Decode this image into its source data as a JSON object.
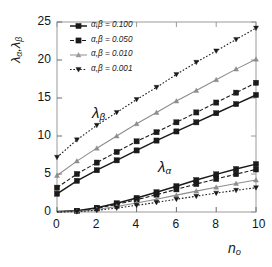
{
  "figure": {
    "background": "#ffffff",
    "frame_color": "#9a9a9a",
    "plot_left_px": 57,
    "plot_right_px": 256,
    "plot_top_px": 22,
    "plot_bottom_px": 212
  },
  "axes": {
    "y_label": "λₐ,λᵦ",
    "y_label_parts": {
      "lambda_alpha": "λ",
      "sub_alpha": "α",
      "lambda_beta": "λ",
      "sub_beta": "β"
    },
    "x_label_base": "n",
    "x_label_sub": "o",
    "y_ticks": [
      "0",
      "5",
      "10",
      "15",
      "20",
      "25"
    ],
    "x_ticks": [
      "0",
      "2",
      "4",
      "6",
      "8",
      "10"
    ]
  },
  "annotations": {
    "lambda_beta": {
      "base": "λ",
      "sub": "β",
      "x_px": 92,
      "y_px": 104
    },
    "lambda_alpha": {
      "base": "λ",
      "sub": "α",
      "x_px": 158,
      "y_px": 158
    }
  },
  "legend": {
    "x_px": 70,
    "y_px": 26,
    "entries": [
      {
        "label": "α,β = 0.100",
        "marker": "square-filled",
        "line": "solid",
        "color": "#1a1a1a"
      },
      {
        "label": "α,β = 0.050",
        "marker": "square-filled",
        "line": "dashed",
        "color": "#1a1a1a"
      },
      {
        "label": "α,β = 0.010",
        "marker": "triangle-up",
        "line": "solid-light",
        "color": "#9a9a9a"
      },
      {
        "label": "α,β = 0.001",
        "marker": "triangle-down",
        "line": "dotted",
        "color": "#1a1a1a"
      }
    ]
  },
  "chart_data": {
    "type": "line",
    "title": "",
    "xlabel": "n_o",
    "ylabel": "lambda_alpha, lambda_beta",
    "xlim": [
      0,
      10
    ],
    "ylim": [
      0,
      25
    ],
    "grid": false,
    "legend_position": "top-left inside",
    "x": [
      0,
      1,
      2,
      3,
      4,
      5,
      6,
      7,
      8,
      9,
      10
    ],
    "groups": [
      {
        "name": "lambda_beta",
        "label": "λ_β",
        "series": [
          {
            "name": "α,β = 0.100",
            "marker": "square-filled",
            "line": "solid",
            "color": "#1a1a1a",
            "values": [
              2.4,
              4.1,
              5.5,
              6.8,
              8.1,
              9.4,
              10.6,
              11.8,
              13.0,
              14.2,
              15.4
            ]
          },
          {
            "name": "α,β = 0.050",
            "marker": "square-filled",
            "line": "dashed",
            "color": "#1a1a1a",
            "values": [
              3.2,
              5.0,
              6.5,
              7.9,
              9.3,
              10.5,
              11.8,
              13.1,
              14.4,
              15.7,
              17.0
            ]
          },
          {
            "name": "α,β = 0.010",
            "marker": "triangle-up",
            "line": "solid-light",
            "color": "#8d8d8d",
            "values": [
              4.8,
              6.7,
              8.4,
              10.0,
              11.6,
              13.1,
              14.6,
              16.0,
              17.4,
              18.8,
              20.1
            ]
          },
          {
            "name": "α,β = 0.001",
            "marker": "triangle-down",
            "line": "dotted",
            "color": "#1a1a1a",
            "values": [
              7.2,
              9.5,
              11.4,
              13.1,
              14.8,
              16.4,
              18.1,
              19.7,
              21.2,
              22.7,
              24.2
            ]
          }
        ]
      },
      {
        "name": "lambda_alpha",
        "label": "λ_α",
        "series": [
          {
            "name": "α,β = 0.100",
            "marker": "square-filled",
            "line": "solid",
            "color": "#1a1a1a",
            "values": [
              0.05,
              0.15,
              0.55,
              1.15,
              1.85,
              2.6,
              3.4,
              4.2,
              4.95,
              5.65,
              6.3
            ]
          },
          {
            "name": "α,β = 0.050",
            "marker": "square-filled",
            "line": "dashed",
            "color": "#1a1a1a",
            "values": [
              0.04,
              0.12,
              0.48,
              1.0,
              1.62,
              2.28,
              2.98,
              3.68,
              4.35,
              4.98,
              5.6
            ]
          },
          {
            "name": "α,β = 0.010",
            "marker": "triangle-up",
            "line": "solid-light",
            "color": "#8d8d8d",
            "values": [
              0.02,
              0.07,
              0.32,
              0.72,
              1.18,
              1.68,
              2.22,
              2.75,
              3.25,
              3.75,
              4.2
            ]
          },
          {
            "name": "α,β = 0.001",
            "marker": "triangle-down",
            "line": "dotted",
            "color": "#1a1a1a",
            "values": [
              0.01,
              0.04,
              0.22,
              0.52,
              0.88,
              1.26,
              1.68,
              2.08,
              2.48,
              2.85,
              3.2
            ]
          }
        ]
      }
    ]
  }
}
